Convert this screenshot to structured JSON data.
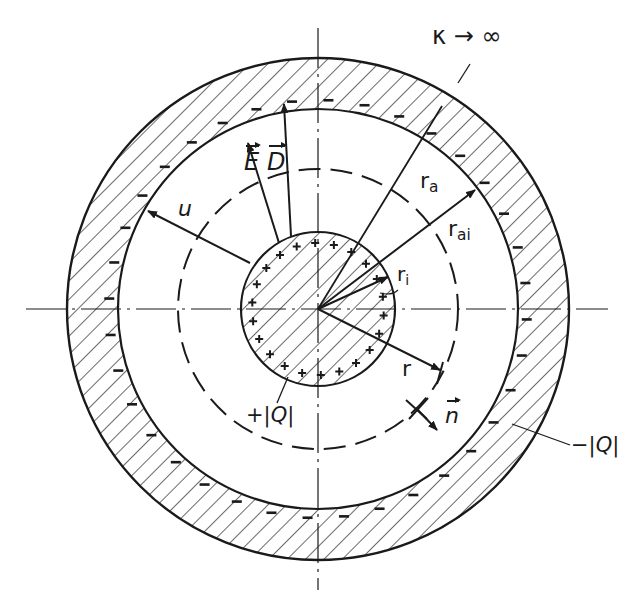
{
  "diagram": {
    "colors": {
      "ink": "#1a1a1a",
      "background": "#ffffff"
    },
    "geometry": {
      "center": [
        318,
        309
      ],
      "inner_sphere_radius": 77,
      "dashed_surface_radius": 140,
      "outer_shell_inner_radius": 200,
      "outer_shell_outer_radius": 251
    },
    "labels": {
      "conductivity": "κ → ∞",
      "field_E": "E",
      "field_D": "D",
      "potential": "u",
      "r_a": "r",
      "r_a_sub": "a",
      "r_ai": "r",
      "r_ai_sub": "ai",
      "r_i": "r",
      "r_i_sub": "i",
      "r": "r",
      "normal": "n",
      "positive_charge": "+|Q|",
      "negative_charge": "−|Q|"
    },
    "symbols": {
      "positive_sign": "+",
      "negative_sign": "−"
    }
  }
}
